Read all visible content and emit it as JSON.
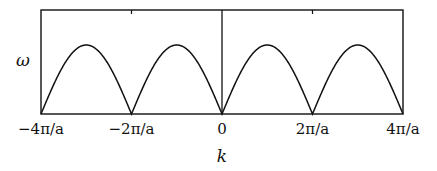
{
  "chart_data": {
    "type": "line",
    "title": "",
    "xlabel": "k",
    "ylabel": "ω",
    "x_ticks": [
      {
        "value": -4,
        "label": "−4π/a"
      },
      {
        "value": -2,
        "label": "−2π/a"
      },
      {
        "value": 0,
        "label": "0"
      },
      {
        "value": 2,
        "label": "2π/a"
      },
      {
        "value": 4,
        "label": "4π/a"
      }
    ],
    "x_unit": "π/a",
    "xlim": [
      -4,
      4
    ],
    "ylim": [
      0,
      1.5
    ],
    "grid": false,
    "legend": null,
    "series": [
      {
        "name": "ω(k) = ω_max |sin(ka/2)|",
        "function": "abs_sin_half",
        "omega_max": 1.0,
        "x": [
          -4,
          -3.5,
          -3,
          -2.5,
          -2,
          -1.5,
          -1,
          -0.5,
          0,
          0.5,
          1,
          1.5,
          2,
          2.5,
          3,
          3.5,
          4
        ],
        "y": [
          0,
          0.707,
          1,
          0.707,
          0,
          0.707,
          1,
          0.707,
          0,
          0.707,
          1,
          0.707,
          0,
          0.707,
          1,
          0.707,
          0
        ]
      }
    ],
    "annotations": [
      {
        "type": "vertical_line",
        "x": 0
      }
    ]
  },
  "labels": {
    "ylabel": "ω",
    "xlabel": "k",
    "ticks": [
      "−4π/a",
      "−2π/a",
      "0",
      "2π/a",
      "4π/a"
    ]
  }
}
